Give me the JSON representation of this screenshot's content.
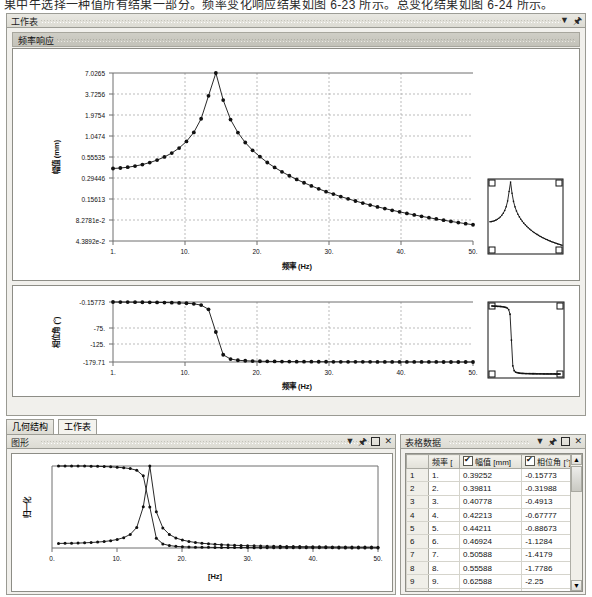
{
  "top_text": "果中午选择一种值所有结果一部分。频率变化响应结果如图 6-23 所示。总变化结果如图 6-24 所示。",
  "top_panel": {
    "tab_label": "工作表",
    "controls": [
      "chevron-down-icon",
      "pin-icon"
    ],
    "panel_title": "频率响应"
  },
  "chart_amplitude": {
    "ylabel": "幅值 (mm)",
    "xlabel": "频率 (Hz)",
    "yticks": [
      "7.0265",
      "3.7256",
      "1.9754",
      "1.0474",
      "0.55535",
      "0.29446",
      "0.15613",
      "8.2781e-2",
      "4.3892e-2"
    ],
    "xticks": [
      "1.",
      "10.",
      "20.",
      "30.",
      "40.",
      "50."
    ]
  },
  "chart_phase": {
    "ylabel": "相位角 (°)",
    "xlabel": "频率 (Hz)",
    "yticks": [
      "-0.15773",
      "-75.",
      "-125.",
      "-179.71"
    ],
    "xticks": [
      "1.",
      "10.",
      "20.",
      "30.",
      "40.",
      "50."
    ]
  },
  "bottom_tabs": [
    {
      "label": "几何结构",
      "active": false
    },
    {
      "label": "工作表",
      "active": true
    }
  ],
  "graph_panel": {
    "title": "图形",
    "controls": [
      "chevron-down-icon",
      "pin-icon",
      "maximize-icon",
      "close-icon"
    ]
  },
  "chart_normalized": {
    "ylabel": "归一化",
    "xlabel": "[Hz]",
    "xticks": [
      "0.",
      "10.",
      "20.",
      "30.",
      "40.",
      "50."
    ]
  },
  "table_panel": {
    "title": "表格数据",
    "controls": [
      "chevron-down-icon",
      "pin-icon",
      "maximize-icon",
      "close-icon"
    ],
    "columns": [
      "",
      "频率 [",
      "幅值 [mm]",
      "相位角 [°]"
    ],
    "col_checkboxes": [
      false,
      false,
      true,
      true
    ],
    "rows": [
      {
        "n": "1",
        "freq": "1.",
        "amp": "0.39252",
        "phase": "-0.15773"
      },
      {
        "n": "2",
        "freq": "2.",
        "amp": "0.39811",
        "phase": "-0.31988"
      },
      {
        "n": "3",
        "freq": "3.",
        "amp": "0.40778",
        "phase": "-0.4913"
      },
      {
        "n": "4",
        "freq": "4.",
        "amp": "0.42213",
        "phase": "-0.67777"
      },
      {
        "n": "5",
        "freq": "5.",
        "amp": "0.44211",
        "phase": "-0.88673"
      },
      {
        "n": "6",
        "freq": "6.",
        "amp": "0.46924",
        "phase": "-1.1284"
      },
      {
        "n": "7",
        "freq": "7.",
        "amp": "0.50588",
        "phase": "-1.4179"
      },
      {
        "n": "8",
        "freq": "8.",
        "amp": "0.55588",
        "phase": "-1.7786"
      },
      {
        "n": "9",
        "freq": "9.",
        "amp": "0.62588",
        "phase": "-2.25"
      },
      {
        "n": "10",
        "freq": "10.",
        "amp": "0.72811",
        "phase": "-2.9043"
      }
    ]
  },
  "chart_data": [
    {
      "type": "line",
      "name": "amplitude-frequency-response",
      "title": "频率响应",
      "xlabel": "频率 (Hz)",
      "ylabel": "幅值 (mm)",
      "yscale": "log",
      "xlim": [
        1,
        50
      ],
      "ylim": [
        0.043892,
        7.0265
      ],
      "ytick_values": [
        7.0265,
        3.7256,
        1.9754,
        1.0474,
        0.55535,
        0.29446,
        0.15613,
        0.082781,
        0.043892
      ],
      "xtick_values": [
        1,
        10,
        20,
        30,
        40,
        50
      ],
      "grid": true,
      "legend": "none",
      "x": [
        1,
        2,
        3,
        4,
        5,
        6,
        7,
        8,
        9,
        10,
        11,
        12,
        13,
        14,
        15,
        16,
        17,
        18,
        19,
        20,
        21,
        22,
        23,
        24,
        25,
        26,
        27,
        28,
        29,
        30,
        31,
        32,
        33,
        34,
        35,
        36,
        37,
        38,
        39,
        40,
        41,
        42,
        43,
        44,
        45,
        46,
        47,
        48,
        49,
        50
      ],
      "y": [
        0.39252,
        0.39811,
        0.40778,
        0.42213,
        0.44211,
        0.46924,
        0.50588,
        0.55588,
        0.62588,
        0.72811,
        0.88826,
        1.1682,
        1.7644,
        3.5256,
        7.0265,
        3.1,
        1.72,
        1.16,
        0.86,
        0.68,
        0.56,
        0.47,
        0.405,
        0.355,
        0.315,
        0.282,
        0.255,
        0.232,
        0.212,
        0.195,
        0.181,
        0.168,
        0.157,
        0.147,
        0.138,
        0.13,
        0.123,
        0.117,
        0.111,
        0.106,
        0.101,
        0.0965,
        0.0925,
        0.0888,
        0.0854,
        0.0823,
        0.0793,
        0.0766,
        0.0741,
        0.0717
      ]
    },
    {
      "type": "line",
      "name": "phase-frequency-response",
      "xlabel": "频率 (Hz)",
      "ylabel": "相位角 (°)",
      "xlim": [
        1,
        50
      ],
      "ylim": [
        -179.71,
        -0.15773
      ],
      "ytick_values": [
        -0.15773,
        -75,
        -125,
        -179.71
      ],
      "xtick_values": [
        1,
        10,
        20,
        30,
        40,
        50
      ],
      "grid": true,
      "legend": "none",
      "x": [
        1,
        2,
        3,
        4,
        5,
        6,
        7,
        8,
        9,
        10,
        11,
        12,
        13,
        14,
        15,
        16,
        17,
        18,
        19,
        20,
        21,
        22,
        23,
        24,
        25,
        26,
        27,
        28,
        29,
        30,
        31,
        32,
        33,
        34,
        35,
        36,
        37,
        38,
        39,
        40,
        41,
        42,
        43,
        44,
        45,
        46,
        47,
        48,
        49,
        50
      ],
      "y": [
        -0.158,
        -0.32,
        -0.491,
        -0.678,
        -0.887,
        -1.128,
        -1.418,
        -1.779,
        -2.25,
        -2.904,
        -3.9,
        -5.6,
        -9.5,
        -22,
        -90,
        -158,
        -171,
        -174.5,
        -176,
        -176.9,
        -177.4,
        -177.8,
        -178.1,
        -178.3,
        -178.5,
        -178.6,
        -178.7,
        -178.8,
        -178.9,
        -179,
        -179.05,
        -179.1,
        -179.15,
        -179.2,
        -179.25,
        -179.3,
        -179.35,
        -179.4,
        -179.45,
        -179.5,
        -179.52,
        -179.55,
        -179.57,
        -179.6,
        -179.62,
        -179.64,
        -179.66,
        -179.68,
        -179.7,
        -179.71
      ]
    },
    {
      "type": "line",
      "name": "normalized-response",
      "xlabel": "[Hz]",
      "ylabel": "归一化",
      "xlim": [
        0,
        50
      ],
      "ylim": [
        0,
        1
      ],
      "xtick_values": [
        0,
        10,
        20,
        30,
        40,
        50
      ],
      "grid": false,
      "legend": "none",
      "series": [
        {
          "name": "normalized-phase",
          "x": [
            1,
            2,
            3,
            4,
            5,
            6,
            7,
            8,
            9,
            10,
            11,
            12,
            13,
            14,
            15,
            16,
            17,
            18,
            19,
            20,
            21,
            22,
            23,
            24,
            25,
            26,
            27,
            28,
            29,
            30,
            31,
            32,
            33,
            34,
            35,
            36,
            37,
            38,
            39,
            40,
            41,
            42,
            43,
            44,
            45,
            46,
            47,
            48,
            49,
            50
          ],
          "y": [
            1,
            1,
            1,
            1,
            1,
            0.998,
            0.996,
            0.993,
            0.99,
            0.985,
            0.978,
            0.968,
            0.948,
            0.88,
            0.5,
            0.12,
            0.05,
            0.03,
            0.02,
            0.015,
            0.012,
            0.01,
            0.009,
            0.008,
            0.007,
            0.006,
            0.006,
            0.005,
            0.005,
            0.005,
            0.004,
            0.004,
            0.004,
            0.003,
            0.003,
            0.003,
            0.003,
            0.002,
            0.002,
            0.002,
            0.002,
            0.002,
            0.002,
            0.001,
            0.001,
            0.001,
            0.001,
            0.001,
            0.001,
            0.001
          ]
        },
        {
          "name": "normalized-amplitude",
          "x": [
            1,
            2,
            3,
            4,
            5,
            6,
            7,
            8,
            9,
            10,
            11,
            12,
            13,
            14,
            15,
            16,
            17,
            18,
            19,
            20,
            21,
            22,
            23,
            24,
            25,
            26,
            27,
            28,
            29,
            30,
            31,
            32,
            33,
            34,
            35,
            36,
            37,
            38,
            39,
            40,
            41,
            42,
            43,
            44,
            45,
            46,
            47,
            48,
            49,
            50
          ],
          "y": [
            0.056,
            0.057,
            0.058,
            0.06,
            0.063,
            0.067,
            0.072,
            0.079,
            0.089,
            0.104,
            0.126,
            0.166,
            0.251,
            0.502,
            1.0,
            0.441,
            0.245,
            0.165,
            0.122,
            0.097,
            0.08,
            0.067,
            0.058,
            0.051,
            0.045,
            0.04,
            0.036,
            0.033,
            0.03,
            0.028,
            0.026,
            0.024,
            0.022,
            0.021,
            0.02,
            0.018,
            0.017,
            0.017,
            0.016,
            0.015,
            0.014,
            0.014,
            0.013,
            0.013,
            0.012,
            0.012,
            0.011,
            0.011,
            0.011,
            0.01
          ]
        }
      ]
    }
  ]
}
